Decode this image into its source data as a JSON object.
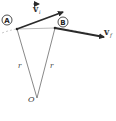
{
  "diagram": {
    "points": {
      "A": {
        "label": "A"
      },
      "B": {
        "label": "B"
      },
      "O": {
        "label": "O"
      }
    },
    "vectors": {
      "vi": {
        "symbol": "v",
        "subscript": "i"
      },
      "vf": {
        "symbol": "v",
        "subscript": "f"
      }
    },
    "radius_labels": [
      "r",
      "r"
    ],
    "colors": {
      "arrow": "#2a2a2a",
      "radius_line": "#555555",
      "chord": "#aaaaaa",
      "dashed_path": "#bbbbbb"
    }
  }
}
